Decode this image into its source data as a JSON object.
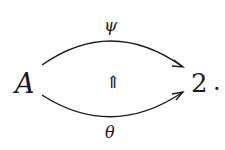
{
  "diagram": {
    "source": {
      "label": "A"
    },
    "target": {
      "label": "2"
    },
    "trailing_punctuation": ".",
    "arrows": [
      {
        "label": "ψ",
        "from": "A",
        "to": "2",
        "position": "top"
      },
      {
        "label": "θ",
        "from": "A",
        "to": "2",
        "position": "bottom"
      }
    ],
    "two_cell": {
      "label": "⇑",
      "direction": "up",
      "from": "θ",
      "to": "ψ"
    }
  }
}
